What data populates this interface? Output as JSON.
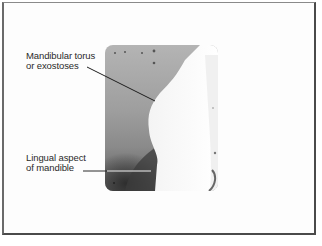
{
  "figure": {
    "annotations": [
      {
        "id": "torus",
        "lines": [
          "Mandibular torus",
          "or exostoses"
        ]
      },
      {
        "id": "lingual",
        "lines": [
          "Lingual aspect",
          "of mandible"
        ]
      }
    ],
    "colors": {
      "border": "#4a4a4a",
      "text": "#2a2a2a",
      "bone_light": "#ffffff",
      "soft_tissue": "#9e9e9e",
      "dark_region": "#3c3c3c"
    }
  }
}
